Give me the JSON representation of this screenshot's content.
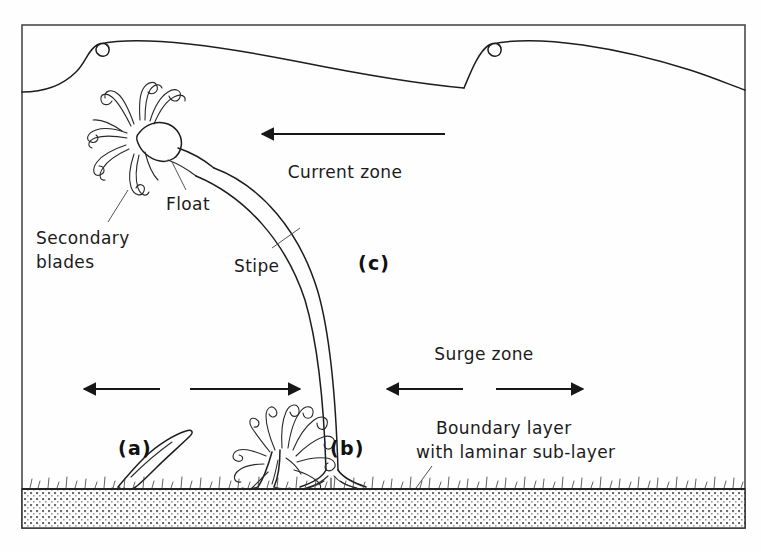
{
  "figure": {
    "frame": {
      "x": 22,
      "y": 25,
      "width": 723,
      "height": 503
    },
    "colors": {
      "ink": "#1d1d1d",
      "frame": "#4a4a4a",
      "label_text": "#1b1b1b",
      "background": "#fefefe",
      "substrate": "#4a4a4a"
    }
  },
  "labels": {
    "secondary_blades": "Secondary\nblades",
    "secondary_blades_line1": "Secondary",
    "secondary_blades_line2": "blades",
    "float": "Float",
    "stipe": "Stipe",
    "current_zone": "Current zone",
    "surge_zone": "Surge zone",
    "boundary_layer_line1": "Boundary layer",
    "boundary_layer_line2": "with laminar sub-layer",
    "stage_a": "(a)",
    "stage_b": "(b)",
    "stage_c": "(c)"
  },
  "zones": [
    {
      "id": "current-zone",
      "label": "Current zone",
      "arrow": "single-left"
    },
    {
      "id": "surge-zone",
      "label": "Surge zone",
      "arrow": "double-horizontal"
    },
    {
      "id": "boundary-layer",
      "label": "Boundary layer with laminar sub-layer",
      "arrow": "none"
    }
  ],
  "growth_stages": [
    {
      "id": "a",
      "label": "(a)",
      "description": "juvenile single blade"
    },
    {
      "id": "b",
      "label": "(b)",
      "description": "bushy secondary blades near substrate"
    },
    {
      "id": "c",
      "label": "(c)",
      "description": "mature plant with long stipe and float"
    }
  ],
  "anatomy": [
    {
      "id": "float",
      "label": "Float"
    },
    {
      "id": "stipe",
      "label": "Stipe"
    },
    {
      "id": "secondary-blades",
      "label": "Secondary blades"
    }
  ]
}
